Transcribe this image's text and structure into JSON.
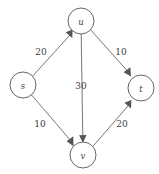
{
  "diagram": {
    "type": "directed-graph",
    "background_color": "#ffffff",
    "node_stroke_color": "#555555",
    "edge_stroke_color": "#666666",
    "label_color": "#3a3a3a",
    "nodes": [
      {
        "id": "s",
        "label": "s",
        "cx": 23,
        "cy": 85,
        "r": 13
      },
      {
        "id": "u",
        "label": "u",
        "cx": 81,
        "cy": 21,
        "r": 13
      },
      {
        "id": "v",
        "label": "v",
        "cx": 83,
        "cy": 155,
        "r": 13
      },
      {
        "id": "t",
        "label": "t",
        "cx": 141,
        "cy": 88,
        "r": 13
      }
    ],
    "edges": [
      {
        "id": "s-u",
        "from": "s",
        "to": "u",
        "capacity": "20",
        "label_x": 41,
        "label_y": 52
      },
      {
        "id": "s-v",
        "from": "s",
        "to": "v",
        "capacity": "10",
        "label_x": 40,
        "label_y": 124
      },
      {
        "id": "u-v",
        "from": "u",
        "to": "v",
        "capacity": "30",
        "label_x": 81,
        "label_y": 86
      },
      {
        "id": "u-t",
        "from": "u",
        "to": "t",
        "capacity": "10",
        "label_x": 121,
        "label_y": 52
      },
      {
        "id": "v-t",
        "from": "v",
        "to": "t",
        "capacity": "20",
        "label_x": 122,
        "label_y": 124
      }
    ]
  }
}
